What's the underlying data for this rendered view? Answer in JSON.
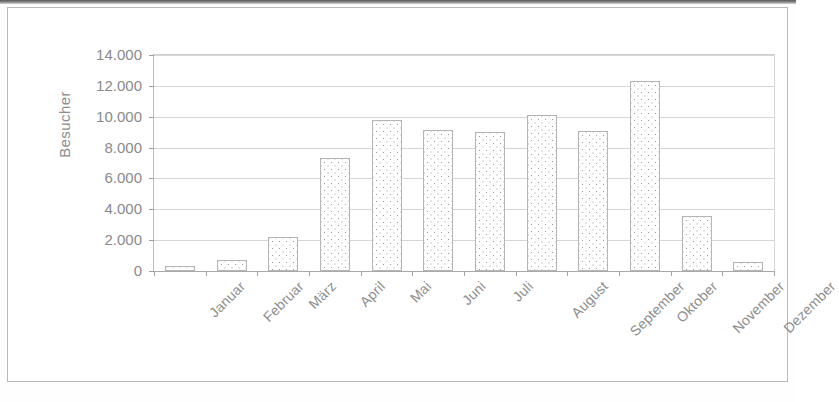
{
  "figure": {
    "background_color": "#ffffff",
    "frame_color": "#b9b9b9",
    "gridline_color": "#d6d6d6",
    "bar_outline_color": "#b5b5b5",
    "bar_fill_pattern": "stippled-dots",
    "text_color": "#8d8d8d"
  },
  "chart_data": {
    "type": "bar",
    "title": "",
    "xlabel": "",
    "ylabel": "Besucher",
    "categories": [
      "Januar",
      "Februar",
      "März",
      "April",
      "Mai",
      "Juni",
      "Juli",
      "August",
      "September",
      "Oktober",
      "November",
      "Dezember"
    ],
    "values": [
      350,
      700,
      2200,
      7350,
      9800,
      9150,
      9000,
      10100,
      9100,
      12300,
      3550,
      600
    ],
    "ylim": [
      0,
      14000
    ],
    "ytick_values": [
      0,
      2000,
      4000,
      6000,
      8000,
      10000,
      12000,
      14000
    ],
    "ytick_labels": [
      "0",
      "2.000",
      "4.000",
      "6.000",
      "8.000",
      "10.000",
      "12.000",
      "14.000"
    ],
    "grid": true,
    "grid_axis": "y",
    "legend": false,
    "legend_position": "none",
    "x_tick_label_rotation": -45,
    "number_format": "de-DE (period as thousands separator)",
    "series": [
      {
        "name": "Besucher",
        "values": [
          350,
          700,
          2200,
          7350,
          9800,
          9150,
          9000,
          10100,
          9100,
          12300,
          3550,
          600
        ]
      }
    ]
  }
}
